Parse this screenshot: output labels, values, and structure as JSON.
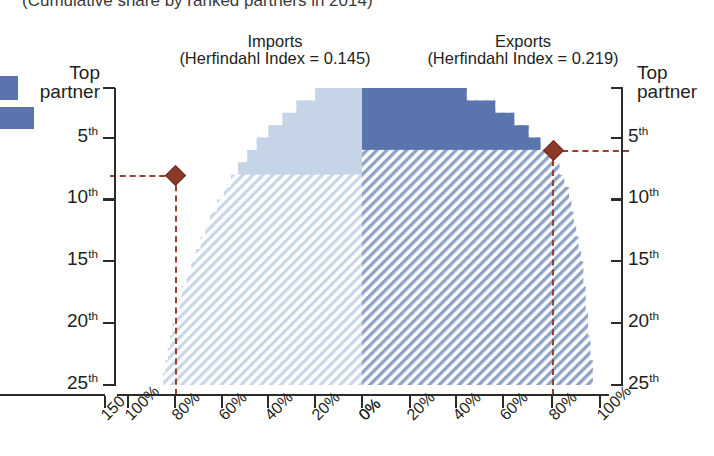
{
  "titles": {
    "subtitle": "(Cumulative share by ranked partners in 2014)",
    "imports_label": "Imports",
    "imports_index": "(Herfindahl Index = 0.145)",
    "exports_label": "Exports",
    "exports_index": "(Herfindahl Index = 0.219)"
  },
  "axes": {
    "y_top_label_line1": "Top",
    "y_top_label_line2": "partner",
    "y_ticks": [
      "5",
      "10",
      "15",
      "20",
      "25"
    ],
    "y_suffix": "th",
    "x_left_ticks": [
      "100%",
      "80%",
      "60%",
      "40%",
      "20%",
      "0%"
    ],
    "x_right_ticks": [
      "0%",
      "20%",
      "40%",
      "60%",
      "80%",
      "100%"
    ],
    "x_far_left_tick": "150"
  },
  "colors": {
    "imports_fill": "#c6d4e8",
    "imports_hatch": "#c6d4e8",
    "exports_fill": "#5a75ad",
    "exports_hatch": "#8fa3c8",
    "marker": "#8c3a28",
    "guide_line": "#9c3f2a",
    "axis": "#2b2b2b",
    "legend_swatch": "#5a75ad"
  },
  "chart_data": {
    "type": "area",
    "title": "(Cumulative share by ranked partners in 2014)",
    "xlabel": "",
    "ylabel": "Partner rank",
    "grid": false,
    "legend_position": "left-offscreen",
    "panels": [
      {
        "name": "Imports",
        "herfindahl_index": 0.145,
        "direction": "right-to-left",
        "xlim": [
          100,
          0
        ],
        "ylim": [
          1,
          25
        ],
        "marker_rank": 8,
        "marker_share": 80,
        "solid_region_bottom_rank": 8,
        "ranks": [
          1,
          2,
          3,
          4,
          5,
          6,
          7,
          8,
          9,
          10,
          11,
          12,
          13,
          14,
          15,
          16,
          17,
          18,
          19,
          20,
          21,
          22,
          23,
          24,
          25
        ],
        "cumulative_share": [
          20,
          28,
          34,
          40,
          45,
          49,
          53,
          56,
          59,
          62,
          65,
          67,
          69,
          71,
          73,
          75,
          77,
          78,
          80,
          81,
          82,
          83,
          84,
          85,
          86
        ]
      },
      {
        "name": "Exports",
        "herfindahl_index": 0.219,
        "direction": "left-to-right",
        "xlim": [
          0,
          100
        ],
        "ylim": [
          1,
          25
        ],
        "marker_rank": 6,
        "marker_share": 80,
        "solid_region_bottom_rank": 6,
        "ranks": [
          1,
          2,
          3,
          4,
          5,
          6,
          7,
          8,
          9,
          10,
          11,
          12,
          13,
          14,
          15,
          16,
          17,
          18,
          19,
          20,
          21,
          22,
          23,
          24,
          25
        ],
        "cumulative_share": [
          44,
          56,
          64,
          70,
          75,
          80,
          83,
          85,
          87,
          88,
          89,
          90,
          91,
          92,
          93,
          93,
          94,
          94,
          95,
          95,
          96,
          96,
          97,
          97,
          98
        ]
      }
    ]
  }
}
